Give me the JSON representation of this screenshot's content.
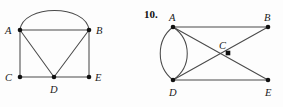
{
  "figure": {
    "number_label": "10.",
    "background_color": "#fdfdfd",
    "edge_color": "#4a4a4a",
    "vertex_color": "#111111",
    "width": 283,
    "height": 107
  },
  "graph_left": {
    "name": "graph-left",
    "vertices": [
      {
        "id": "A",
        "label": "A",
        "cx": 20,
        "cy": 30,
        "label_x": 5,
        "label_y": 34
      },
      {
        "id": "B",
        "label": "B",
        "cx": 89,
        "cy": 30,
        "label_x": 96,
        "label_y": 34
      },
      {
        "id": "C",
        "label": "C",
        "cx": 20,
        "cy": 77,
        "label_x": 5,
        "label_y": 81
      },
      {
        "id": "D",
        "label": "D",
        "cx": 54,
        "cy": 77,
        "label_x": 50,
        "label_y": 93
      },
      {
        "id": "E",
        "label": "E",
        "cx": 89,
        "cy": 77,
        "label_x": 95,
        "label_y": 81
      }
    ],
    "edges": [
      {
        "from": "A",
        "to": "B",
        "kind": "straight"
      },
      {
        "from": "A",
        "to": "B",
        "kind": "arc",
        "bulge": "up"
      },
      {
        "from": "A",
        "to": "C",
        "kind": "straight"
      },
      {
        "from": "A",
        "to": "D",
        "kind": "straight"
      },
      {
        "from": "B",
        "to": "D",
        "kind": "straight"
      },
      {
        "from": "B",
        "to": "E",
        "kind": "straight"
      },
      {
        "from": "C",
        "to": "D",
        "kind": "straight"
      },
      {
        "from": "D",
        "to": "E",
        "kind": "straight"
      }
    ]
  },
  "graph_right": {
    "name": "graph-right",
    "vertices": [
      {
        "id": "A",
        "label": "A",
        "cx": 173,
        "cy": 27,
        "label_x": 169,
        "label_y": 21
      },
      {
        "id": "B",
        "label": "B",
        "cx": 268,
        "cy": 27,
        "label_x": 264,
        "label_y": 21
      },
      {
        "id": "C",
        "label": "C",
        "cx": 228,
        "cy": 53,
        "label_x": 219,
        "label_y": 49
      },
      {
        "id": "D",
        "label": "D",
        "cx": 173,
        "cy": 80,
        "label_x": 169,
        "label_y": 96
      },
      {
        "id": "E",
        "label": "E",
        "cx": 268,
        "cy": 80,
        "label_x": 265,
        "label_y": 96
      }
    ],
    "edges": [
      {
        "from": "A",
        "to": "B",
        "kind": "straight"
      },
      {
        "from": "A",
        "to": "E",
        "kind": "straight"
      },
      {
        "from": "D",
        "to": "B",
        "kind": "straight"
      },
      {
        "from": "D",
        "to": "E",
        "kind": "straight"
      },
      {
        "from": "A",
        "to": "D",
        "kind": "arc",
        "bulge": "left"
      },
      {
        "from": "A",
        "to": "D",
        "kind": "arc",
        "bulge": "right"
      }
    ]
  }
}
